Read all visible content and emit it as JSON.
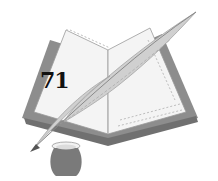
{
  "illustration": {
    "subject": "open book with quill pen and inkwell",
    "number_label": "71",
    "colors": {
      "background": "#ffffff",
      "book_cover": "#8a8a8a",
      "pages": "#f4f4f4",
      "page_lines": "#b5b5b5",
      "quill": "#cfcfcf",
      "quill_shadow": "#9a9a9a",
      "inkwell": "#7a7a7a",
      "text": "#111111"
    }
  }
}
